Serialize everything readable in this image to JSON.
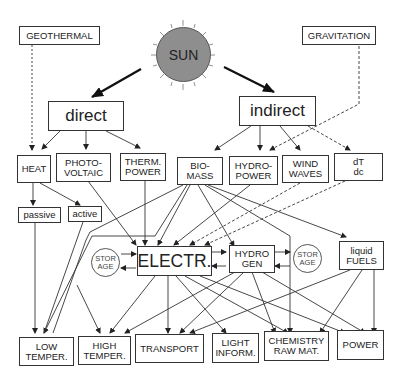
{
  "diagram": {
    "sources": {
      "sun": "SUN",
      "geothermal": "GEOTHERMAL",
      "gravitation": "GRAVITATION"
    },
    "paths": {
      "direct": "direct",
      "indirect": "indirect"
    },
    "conversions": {
      "heat": "HEAT",
      "photovoltaic": [
        "PHOTO-",
        "VOLTAIC"
      ],
      "thermal_power": [
        "THERM.",
        "POWER"
      ],
      "biomass": [
        "BIO-",
        "MASS"
      ],
      "hydropower": [
        "HYDRO-",
        "POWER"
      ],
      "wind_waves": [
        "WIND",
        "WAVES"
      ],
      "dt_dc": [
        "dT",
        "dc"
      ],
      "passive": "passive",
      "active": "active"
    },
    "carriers": {
      "electricity": "ELECTR.",
      "hydrogen": [
        "HYDRO",
        "GEN"
      ],
      "liquid_fuels": [
        "liquid",
        "FUELS"
      ],
      "storage_left": [
        "STOR",
        "AGE"
      ],
      "storage_right": [
        "STOR",
        "AGE"
      ]
    },
    "uses": {
      "low_temp": [
        "LOW",
        "TEMPER."
      ],
      "high_temp": [
        "HIGH",
        "TEMPER."
      ],
      "transport": "TRANSPORT",
      "light_inform": [
        "LIGHT",
        "INFORM."
      ],
      "chemistry": [
        "CHEMISTRY",
        "RAW MAT."
      ],
      "power": "POWER"
    },
    "colors": {
      "line": "#333333",
      "sun_fill": "#8e8e8e",
      "background": "#ffffff"
    }
  }
}
